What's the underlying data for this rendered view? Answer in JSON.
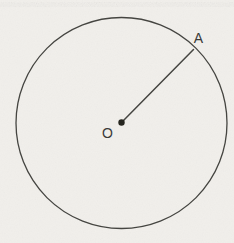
{
  "figure": {
    "type": "geometry-diagram",
    "background_color": "#f1efeb",
    "stroke_color": "#454541",
    "point_color": "#26261f",
    "canvas": {
      "width": 234,
      "height": 243
    },
    "circle": {
      "cx": 121.5,
      "cy": 123,
      "r": 105.5
    },
    "center_point": {
      "cx": 121.5,
      "cy": 122.5,
      "r": 3.2
    },
    "radius_line": {
      "x1": 122.5,
      "y1": 121.5,
      "x2": 193.5,
      "y2": 49.5
    },
    "labels": {
      "center": {
        "text": "O",
        "x": 107.5,
        "y": 137.5
      },
      "endpoint": {
        "text": "A",
        "x": 198.5,
        "y": 43
      }
    }
  }
}
